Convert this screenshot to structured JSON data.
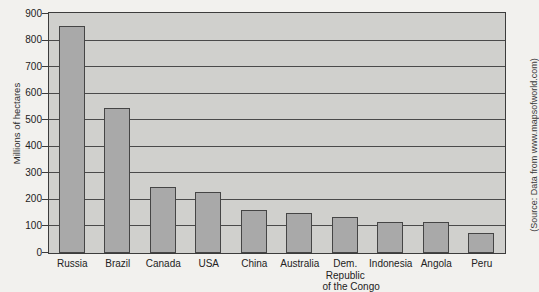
{
  "chart_data": {
    "type": "bar",
    "title": "",
    "xlabel": "",
    "ylabel": "Millions of hectares",
    "ylim": [
      0,
      900
    ],
    "ytick_step": 100,
    "yticks": [
      900,
      800,
      700,
      600,
      500,
      400,
      300,
      200,
      100,
      0
    ],
    "grid": true,
    "legend": "none",
    "categories": [
      "Russia",
      "Brazil",
      "Canada",
      "USA",
      "China",
      "Australia",
      "Dem. Republic of the Congo",
      "Indonesia",
      "Angola",
      "Peru"
    ],
    "category_lines": [
      [
        "Russia"
      ],
      [
        "Brazil"
      ],
      [
        "Canada"
      ],
      [
        "USA"
      ],
      [
        "China"
      ],
      [
        "Australia"
      ],
      [
        "Dem.",
        "Republic",
        "of the Congo"
      ],
      [
        "Indonesia"
      ],
      [
        "Angola"
      ],
      [
        "Peru"
      ]
    ],
    "values": [
      855,
      547,
      249,
      228,
      163,
      149,
      134,
      118,
      118,
      74
    ],
    "source_note": "(Source: Data from www.mapsofworld.com)",
    "colors": {
      "bar_fill": "#a9a9a9",
      "bar_edge": "#454545",
      "plot_background": "#d0d0cd",
      "gridline": "#4a4a4a",
      "figure_background": "#f2f1ee",
      "text": "#222222"
    }
  }
}
